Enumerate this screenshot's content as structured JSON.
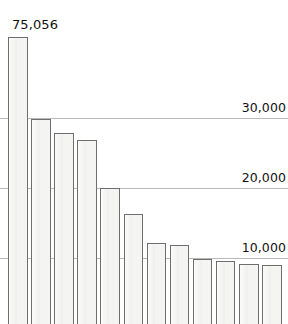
{
  "chart_data": {
    "type": "bar",
    "title": "",
    "subtitle": "",
    "xlabel": "",
    "ylabel": "",
    "categories": [
      "USA",
      "Italy",
      "France",
      "Spain",
      "UK",
      "Germany",
      "Austria",
      "China",
      "Australia",
      "H. Kong",
      "Canada",
      "Poland"
    ],
    "values": [
      75056,
      29900,
      27900,
      26800,
      20000,
      16300,
      12200,
      11900,
      9800,
      9600,
      9100,
      9000
    ],
    "value_labels": [
      "75,056",
      "",
      "",
      "",
      "",
      "",
      "",
      "",
      "",
      "",
      "",
      ""
    ],
    "ylim": [
      0,
      32000
    ],
    "y_ticks": [
      10000,
      20000,
      30000
    ],
    "y_tick_labels": [
      "10,000",
      "20,000",
      "30,000"
    ],
    "grid": true,
    "grid_axis": "y",
    "legend": false,
    "legend_position": "none",
    "bar_fill": "#f4f4f2",
    "bar_border": "#6e6e6e",
    "gridline_color": "#b9b9b9",
    "text_color": "#111111",
    "background": "#ffffff"
  },
  "annotations": {
    "usa_value": "75,056"
  }
}
